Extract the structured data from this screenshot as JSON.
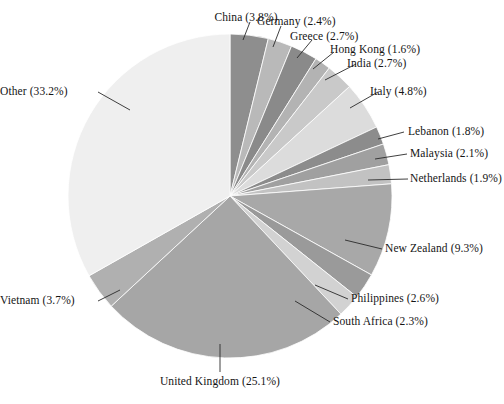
{
  "chart_data": {
    "type": "pie",
    "title": "",
    "xlabel": "",
    "ylabel": "",
    "legend_position": "none",
    "grid": false,
    "label_format": "{name} ({value}%)",
    "start_angle_deg": 0,
    "direction": "clockwise",
    "total": 100.0,
    "categories": [
      "China",
      "Germany",
      "Greece",
      "Hong Kong",
      "India",
      "Italy",
      "Lebanon",
      "Malaysia",
      "Netherlands",
      "New Zealand",
      "Philippines",
      "South Africa",
      "United Kingdom",
      "Vietnam",
      "Other"
    ],
    "values": [
      3.8,
      2.4,
      2.7,
      1.6,
      2.7,
      4.8,
      1.8,
      2.1,
      1.9,
      9.3,
      2.6,
      2.3,
      25.1,
      3.7,
      33.2
    ],
    "colors": [
      "#8e8e8e",
      "#b9b9b9",
      "#8a8a8a",
      "#b3b3b3",
      "#c9c9c9",
      "#dcdcdc",
      "#8c8c8c",
      "#a0a0a0",
      "#c2c2c2",
      "#a8a8a8",
      "#9a9a9a",
      "#d2d2d2",
      "#a6a6a6",
      "#b0b0b0",
      "#efefef"
    ],
    "slices": [
      {
        "name": "China",
        "value": 3.8,
        "label": "China (3.8%)"
      },
      {
        "name": "Germany",
        "value": 2.4,
        "label": "Germany (2.4%)"
      },
      {
        "name": "Greece",
        "value": 2.7,
        "label": "Greece (2.7%)"
      },
      {
        "name": "Hong Kong",
        "value": 1.6,
        "label": "Hong Kong (1.6%)"
      },
      {
        "name": "India",
        "value": 2.7,
        "label": "India (2.7%)"
      },
      {
        "name": "Italy",
        "value": 4.8,
        "label": "Italy (4.8%)"
      },
      {
        "name": "Lebanon",
        "value": 1.8,
        "label": "Lebanon (1.8%)"
      },
      {
        "name": "Malaysia",
        "value": 2.1,
        "label": "Malaysia (2.1%)"
      },
      {
        "name": "Netherlands",
        "value": 1.9,
        "label": "Netherlands (1.9%)"
      },
      {
        "name": "New Zealand",
        "value": 9.3,
        "label": "New Zealand (9.3%)"
      },
      {
        "name": "Philippines",
        "value": 2.6,
        "label": "Philippines (2.6%)"
      },
      {
        "name": "South Africa",
        "value": 2.3,
        "label": "South Africa (2.3%)"
      },
      {
        "name": "United Kingdom",
        "value": 25.1,
        "label": "United Kingdom (25.1%)"
      },
      {
        "name": "Vietnam",
        "value": 3.7,
        "label": "Vietnam (3.7%)"
      },
      {
        "name": "Other",
        "value": 33.2,
        "label": "Other (33.2%)"
      }
    ]
  },
  "labels": {
    "china": "China (3.8%)",
    "germany": "Germany (2.4%)",
    "greece": "Greece (2.7%)",
    "hong_kong": "Hong Kong (1.6%)",
    "india": "India (2.7%)",
    "italy": "Italy (4.8%)",
    "lebanon": "Lebanon (1.8%)",
    "malaysia": "Malaysia (2.1%)",
    "netherlands": "Netherlands (1.9%)",
    "new_zealand": "New Zealand (9.3%)",
    "philippines": "Philippines (2.6%)",
    "south_africa": "South Africa (2.3%)",
    "united_kingdom": "United Kingdom (25.1%)",
    "vietnam": "Vietnam (3.7%)",
    "other": "Other (33.2%)"
  }
}
